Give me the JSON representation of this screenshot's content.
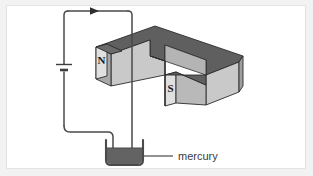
{
  "figure": {
    "background_color": "#f2f2f2",
    "panel_color": "#ffffff",
    "frame_border_color": "#e3e3e3"
  },
  "magnet": {
    "shape": "u-shaped-horseshoe-magnet",
    "north_pole_label": "N",
    "south_pole_label": "S",
    "top_face_color": "#5f5f5f",
    "front_face_color": "#c9c9c9",
    "side_face_color": "#a8a8a8",
    "pole_face_color": "#e0e0e0",
    "outline_color": "#2b2b2b"
  },
  "circuit": {
    "wire_color": "#4a4a4a",
    "current_arrow_name": "current-direction-arrow",
    "battery_label": "",
    "battery_color": "#3d3d3d"
  },
  "trough": {
    "liquid_label": "mercury",
    "liquid_color": "#636363",
    "container_color": "#4a4a4a",
    "leader_line_color": "#4a4a4a"
  }
}
